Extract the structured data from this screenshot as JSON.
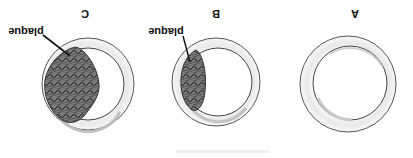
{
  "figure": {
    "orientation": "rotated 180 degrees",
    "panels": [
      {
        "id": "A",
        "label": "A",
        "description": "normal artery cross-section, no plaque",
        "plaque_label": ""
      },
      {
        "id": "B",
        "label": "B",
        "description": "artery with small plaque buildup",
        "plaque_label": "plaque"
      },
      {
        "id": "C",
        "label": "C",
        "description": "artery with large plaque narrowing the lumen",
        "plaque_label": "plaque"
      }
    ],
    "caption": ""
  },
  "colors": {
    "background": "#ffffff",
    "vessel_wall": "#f3f3f3",
    "outline": "#555555",
    "plaque_fill": "#6e6e6e",
    "plaque_texture": "#2e2e2e",
    "label_text": "#111111"
  }
}
